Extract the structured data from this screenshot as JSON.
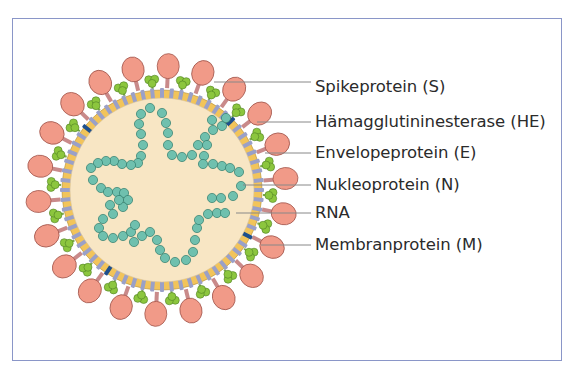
{
  "figure": {
    "labels": [
      {
        "id": "spike",
        "text": "Spikeprotein (S)",
        "y": 22,
        "line_from_x": 214,
        "line_y": 82
      },
      {
        "id": "he",
        "text": "Hämagglutininesterase (HE)",
        "y": 53,
        "line_from_x": 257,
        "line_y": 122
      },
      {
        "id": "envelope",
        "text": "Envelopeprotein (E)",
        "y": 84,
        "line_from_x": 265,
        "line_y": 153
      },
      {
        "id": "nucleo",
        "text": "Nukleoprotein (N)",
        "y": 115,
        "line_from_x": 243,
        "line_y": 185
      },
      {
        "id": "rna",
        "text": "RNA",
        "y": 144,
        "line_from_x": 236,
        "line_y": 213
      },
      {
        "id": "membrane",
        "text": "Membranprotein (M)",
        "y": 174,
        "line_from_x": 261,
        "line_y": 245
      }
    ]
  },
  "colors": {
    "frame": "#8a96c8",
    "core_fill": "#f8e6c4",
    "membrane_yellow": "#f2c45a",
    "membrane_protein": "#9aa0c8",
    "envelope_protein": "#1e4f8c",
    "spike_head": "#f19a88",
    "spike_stalk": "#c98a8a",
    "he_protein": "#8cc63e",
    "nucleocapsid": "#6fc0ae",
    "label_line": "#888888",
    "text": "#2b2b2b"
  },
  "virus": {
    "center": [
      162,
      190
    ],
    "core_radius": 92,
    "membrane_radius": 100,
    "spike_count": 22,
    "rna_chains": [
      [
        [
          150,
          108
        ],
        [
          141,
          114
        ],
        [
          139,
          124
        ],
        [
          141,
          134
        ],
        [
          143,
          145
        ],
        [
          141,
          156
        ],
        [
          138,
          163
        ],
        [
          131,
          165
        ],
        [
          122,
          164
        ],
        [
          114,
          161
        ],
        [
          106,
          161
        ],
        [
          98,
          163
        ],
        [
          91,
          168
        ]
      ],
      [
        [
          162,
          113
        ],
        [
          166,
          123
        ],
        [
          168,
          133
        ],
        [
          168,
          145
        ],
        [
          172,
          155
        ],
        [
          182,
          157
        ],
        [
          192,
          155
        ],
        [
          198,
          145
        ],
        [
          205,
          137
        ],
        [
          213,
          130
        ],
        [
          222,
          126
        ],
        [
          226,
          118
        ],
        [
          212,
          120
        ]
      ],
      [
        [
          207,
          145
        ],
        [
          204,
          156
        ],
        [
          203,
          164
        ],
        [
          213,
          164
        ],
        [
          222,
          166
        ],
        [
          230,
          168
        ],
        [
          239,
          172
        ],
        [
          241,
          186
        ],
        [
          233,
          196
        ],
        [
          221,
          198
        ],
        [
          212,
          198
        ]
      ],
      [
        [
          93,
          180
        ],
        [
          101,
          188
        ],
        [
          108,
          192
        ],
        [
          117,
          192
        ],
        [
          124,
          193
        ],
        [
          128,
          200
        ],
        [
          123,
          207
        ],
        [
          113,
          214
        ],
        [
          103,
          219
        ],
        [
          99,
          228
        ],
        [
          103,
          236
        ],
        [
          113,
          238
        ],
        [
          123,
          236
        ],
        [
          131,
          232
        ],
        [
          135,
          225
        ]
      ],
      [
        [
          134,
          242
        ],
        [
          142,
          236
        ],
        [
          150,
          232
        ],
        [
          157,
          240
        ],
        [
          160,
          250
        ],
        [
          165,
          258
        ],
        [
          175,
          262
        ],
        [
          186,
          260
        ],
        [
          193,
          252
        ],
        [
          195,
          240
        ],
        [
          197,
          228
        ],
        [
          199,
          220
        ],
        [
          208,
          214
        ],
        [
          217,
          213
        ],
        [
          225,
          213
        ]
      ],
      [
        [
          119,
          200
        ],
        [
          110,
          205
        ]
      ]
    ]
  }
}
